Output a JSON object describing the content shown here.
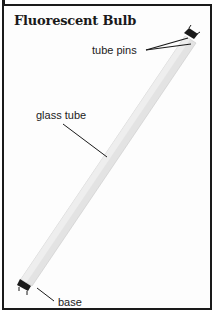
{
  "diagram": {
    "title": "Fluorescent Bulb",
    "labels": {
      "tube_pins": "tube pins",
      "glass_tube": "glass tube",
      "base": "base"
    },
    "colors": {
      "border": "#1a1a1a",
      "tube_fill": "#e4e4e4",
      "tube_shadow": "#c8c8c8",
      "end_cap": "#1a1a1a",
      "leader_line": "#1a1a1a"
    }
  }
}
